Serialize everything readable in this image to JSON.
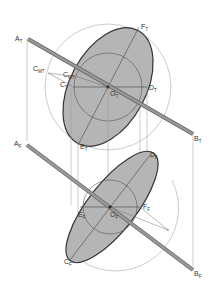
{
  "diagram": {
    "type": "descriptive-geometry",
    "colors": {
      "fill": "#b0b0b0",
      "outline": "#333333",
      "construction": "#999999",
      "rod": "#888888"
    },
    "top_view": {
      "labels": {
        "A": {
          "base": "A",
          "sub": "T"
        },
        "B": {
          "base": "B",
          "sub": "T"
        },
        "F": {
          "base": "F",
          "sub": "T"
        },
        "C": {
          "base": "C",
          "sub": "T"
        },
        "D": {
          "base": "D",
          "sub": "T"
        },
        "O": {
          "base": "O",
          "sub": "T"
        },
        "E": {
          "base": "E",
          "sub": "T"
        },
        "CMT1": {
          "base": "C",
          "sub": "MT"
        },
        "CMT2": {
          "base": "C",
          "sub": "MT"
        }
      }
    },
    "front_view": {
      "labels": {
        "A": {
          "base": "A",
          "sub": "F"
        },
        "B": {
          "base": "B",
          "sub": "F"
        },
        "D": {
          "base": "D",
          "sub": "F"
        },
        "E": {
          "base": "E",
          "sub": "F"
        },
        "O": {
          "base": "O",
          "sub": "F"
        },
        "F": {
          "base": "F",
          "sub": "F"
        },
        "C": {
          "base": "C",
          "sub": "F"
        }
      }
    }
  }
}
